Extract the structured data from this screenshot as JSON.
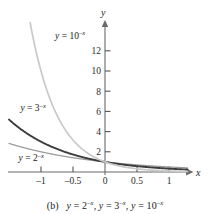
{
  "figure": {
    "label": "(b)",
    "caption_full": "(b)  y = 2⁻ˣ, y = 3⁻ˣ, y = 10⁻ˣ",
    "background": "#ffffff"
  },
  "axes": {
    "x_axis_label": "x",
    "y_axis_label": "y",
    "axis_color": "#555555",
    "x_ticks": [
      {
        "value": -1,
        "label": "–1"
      },
      {
        "value": -0.5,
        "label": "–0.5"
      },
      {
        "value": 0,
        "label": "0"
      },
      {
        "value": 0.5,
        "label": "0.5"
      },
      {
        "value": 1,
        "label": "1"
      }
    ],
    "y_ticks": [
      {
        "value": 2,
        "label": "2"
      },
      {
        "value": 4,
        "label": "4"
      },
      {
        "value": 6,
        "label": "6"
      },
      {
        "value": 8,
        "label": "8"
      },
      {
        "value": 10,
        "label": "10"
      },
      {
        "value": 12,
        "label": "12"
      }
    ]
  },
  "chart_data": {
    "type": "line",
    "xlabel": "x",
    "ylabel": "y",
    "xlim": [
      -1.45,
      1.45
    ],
    "ylim": [
      -0.6,
      13.9
    ],
    "grid": false,
    "legend": "inline-curve-labels",
    "x": [
      -1.45,
      -1.3,
      -1.15,
      -1.0,
      -0.85,
      -0.7,
      -0.55,
      -0.4,
      -0.25,
      -0.1,
      0.0,
      0.15,
      0.3,
      0.5,
      0.7,
      0.9,
      1.1,
      1.3,
      1.45
    ],
    "series": [
      {
        "name": "y = 2⁻ˣ",
        "base": 2,
        "color": "#9a9a9a",
        "label_text": "y = 2",
        "label_exponent": "–x",
        "label_x": -1.35,
        "label_y": 1.05,
        "values": [
          2.73,
          2.46,
          2.22,
          2.0,
          1.8,
          1.62,
          1.46,
          1.32,
          1.19,
          1.07,
          1.0,
          0.9,
          0.81,
          0.71,
          0.62,
          0.54,
          0.47,
          0.41,
          0.37
        ]
      },
      {
        "name": "y = 3⁻ˣ",
        "base": 3,
        "color": "#3c3c3c",
        "label_text": "y = 3",
        "label_exponent": "–x",
        "label_x": -1.32,
        "label_y": 6.05,
        "values": [
          4.79,
          3.83,
          3.06,
          3.0,
          2.33,
          2.16,
          1.83,
          1.55,
          1.32,
          1.12,
          1.0,
          0.85,
          0.72,
          0.58,
          0.46,
          0.37,
          0.3,
          0.24,
          0.21
        ]
      },
      {
        "name": "y = 10⁻ˣ",
        "base": 10,
        "color": "#c9c9c9",
        "label_text": "y = 10",
        "label_exponent": "–x",
        "label_x": -0.78,
        "label_y": 13.2,
        "values": [
          28.2,
          19.95,
          14.13,
          10.0,
          7.08,
          5.01,
          3.55,
          2.51,
          1.78,
          1.26,
          1.0,
          0.71,
          0.5,
          0.32,
          0.2,
          0.13,
          0.08,
          0.05,
          0.035
        ]
      }
    ]
  }
}
